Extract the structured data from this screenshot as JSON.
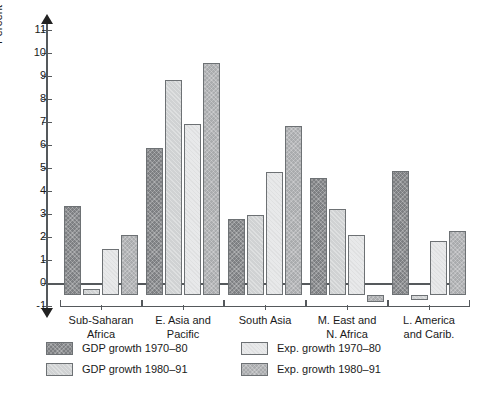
{
  "chart_data": {
    "type": "bar",
    "title": "",
    "xlabel": "",
    "ylabel": "Percent",
    "ylim": [
      -1,
      11
    ],
    "yticks": [
      -1,
      0,
      1,
      2,
      3,
      4,
      5,
      6,
      7,
      8,
      9,
      10,
      11
    ],
    "ytick_labels": [
      "-1",
      "0",
      "1",
      "2",
      "3",
      "4",
      "5",
      "6",
      "7",
      "8",
      "9",
      "10",
      "11"
    ],
    "grid": false,
    "legend_position": "bottom",
    "categories": [
      "Sub-Saharan\nAfrica",
      "E. Asia and\nPacific",
      "South Asia",
      "M. East and\nN. Africa",
      "L. America\nand Carib."
    ],
    "series": [
      {
        "name": "GDP growth 1970–80",
        "color": "#7d7f82",
        "values": [
          3.85,
          6.4,
          3.3,
          5.1,
          5.4
        ]
      },
      {
        "name": "GDP growth 1980–91",
        "color": "#d0d2d3",
        "values": [
          0.25,
          9.35,
          3.5,
          3.75,
          -0.2
        ]
      },
      {
        "name": "Exp. growth 1970–80",
        "color": "#e8e9ea",
        "values": [
          2.0,
          7.45,
          5.35,
          2.6,
          2.35
        ]
      },
      {
        "name": "Exp. growth 1980–91",
        "color": "#a9abad",
        "values": [
          2.6,
          10.1,
          7.35,
          -0.3,
          2.8
        ]
      }
    ]
  }
}
